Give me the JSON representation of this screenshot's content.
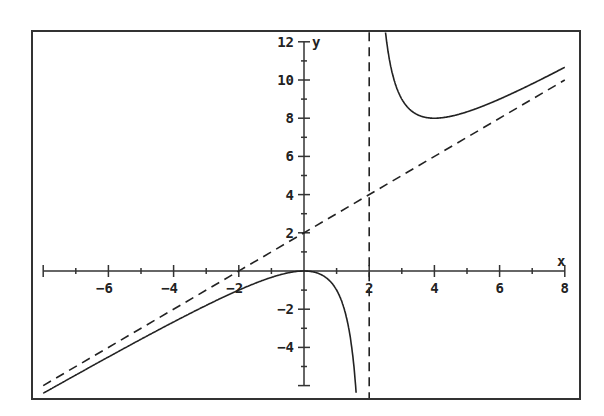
{
  "chart_data": {
    "type": "line",
    "title": "",
    "xlabel": "x",
    "ylabel": "y",
    "xlim": [
      -8,
      8
    ],
    "ylim": [
      -6,
      12
    ],
    "grid": false,
    "legend": null,
    "x_ticks": [
      -6,
      -4,
      -2,
      2,
      4,
      6,
      8
    ],
    "y_ticks": [
      -4,
      -2,
      2,
      4,
      6,
      8,
      10,
      12
    ],
    "x_minor_step": 1,
    "y_minor_step": 1,
    "series": [
      {
        "name": "f(x) = x^2/(x-2)",
        "style": "solid",
        "color": "#222222",
        "domain": [
          -8,
          8
        ],
        "points": [
          [
            -8,
            -6.4
          ],
          [
            -6,
            -4.5
          ],
          [
            -4,
            -2.67
          ],
          [
            -2,
            -1.0
          ],
          [
            -1,
            -0.33
          ],
          [
            0,
            0
          ],
          [
            1,
            -1
          ],
          [
            1.5,
            -4.5
          ],
          [
            1.6,
            -6.4
          ],
          [
            2.6,
            11.27
          ],
          [
            3,
            9
          ],
          [
            4,
            8
          ],
          [
            5,
            8.33
          ],
          [
            6,
            9
          ],
          [
            7,
            9.8
          ],
          [
            8,
            10.67
          ]
        ]
      },
      {
        "name": "slant asymptote y = x + 2",
        "style": "dashed",
        "color": "#222222",
        "points": [
          [
            -8,
            -6
          ],
          [
            8,
            10
          ]
        ]
      },
      {
        "name": "vertical asymptote x = 2",
        "style": "dashed",
        "color": "#222222",
        "points": [
          [
            2,
            -6.7
          ],
          [
            2,
            12.5
          ]
        ]
      }
    ],
    "annotations": []
  }
}
